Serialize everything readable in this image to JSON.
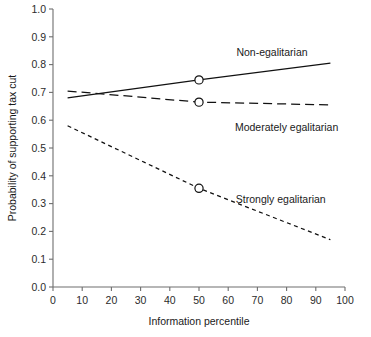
{
  "chart_data": {
    "type": "line",
    "title": "",
    "xlabel": "Information percentile",
    "ylabel": "Probability of supporting tax cut",
    "xlim": [
      0,
      100
    ],
    "ylim": [
      0.0,
      1.0
    ],
    "grid": false,
    "legend_position": "inline-annotations",
    "x_ticks": [
      "0",
      "10",
      "20",
      "30",
      "40",
      "50",
      "60",
      "70",
      "80",
      "90",
      "100"
    ],
    "x_tick_values": [
      0,
      10,
      20,
      30,
      40,
      50,
      60,
      70,
      80,
      90,
      100
    ],
    "y_ticks": [
      "0.0",
      "0.1",
      "0.2",
      "0.3",
      "0.4",
      "0.5",
      "0.6",
      "0.7",
      "0.8",
      "0.9",
      "1.0"
    ],
    "y_tick_values": [
      0.0,
      0.1,
      0.2,
      0.3,
      0.4,
      0.5,
      0.6,
      0.7,
      0.8,
      0.9,
      1.0
    ],
    "series": [
      {
        "name": "Non-egalitarian",
        "style": "solid",
        "x": [
          5,
          50,
          95
        ],
        "values": [
          0.68,
          0.745,
          0.805
        ],
        "marker_x": 50,
        "marker_y": 0.745,
        "label_x": 75,
        "label_y": 0.845
      },
      {
        "name": "Moderately egalitarian",
        "style": "dashed",
        "x": [
          5,
          50,
          95
        ],
        "values": [
          0.705,
          0.665,
          0.655
        ],
        "marker_x": 50,
        "marker_y": 0.665,
        "label_x": 80,
        "label_y": 0.575
      },
      {
        "name": "Strongly egalitarian",
        "style": "dotted",
        "x": [
          5,
          50,
          95
        ],
        "values": [
          0.58,
          0.355,
          0.17
        ],
        "marker_x": 50,
        "marker_y": 0.355,
        "label_x": 78,
        "label_y": 0.315
      }
    ],
    "colors": {
      "line": "#111111",
      "axis": "#6e6e6e",
      "text": "#1a1a1a",
      "background": "#ffffff"
    }
  }
}
